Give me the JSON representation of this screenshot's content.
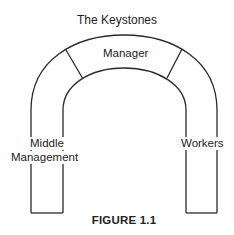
{
  "diagram": {
    "title": "The Keystones",
    "caption": "FIGURE 1.1",
    "arch": {
      "stroke_color": "#2a2a2a",
      "segments": [
        {
          "label": "Manager",
          "position": "top-keystone"
        },
        {
          "label_line1": "Middle",
          "label_line2": "Management",
          "position": "left-pillar"
        },
        {
          "label": "Workers",
          "position": "right-pillar"
        }
      ]
    }
  }
}
